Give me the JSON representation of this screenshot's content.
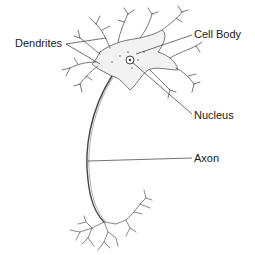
{
  "diagram": {
    "labels": [
      {
        "id": "dendrites",
        "text": "Dendrites"
      },
      {
        "id": "cell_body",
        "text": "Cell Body"
      },
      {
        "id": "nucleus",
        "text": "Nucleus"
      },
      {
        "id": "axon",
        "text": "Axon"
      }
    ],
    "colors": {
      "ink": "#1a1a1a",
      "line": "#333333",
      "sketch": "#555555",
      "shade": "#e8e8e8",
      "background": "#ffffff"
    }
  }
}
